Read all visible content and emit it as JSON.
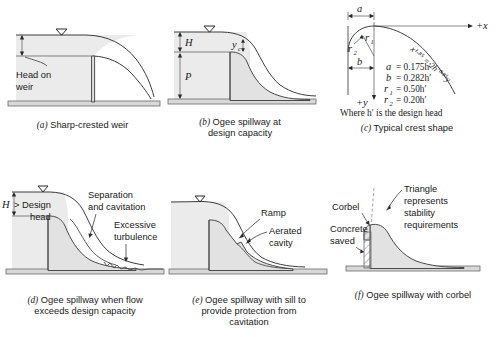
{
  "figure": {
    "panels": [
      {
        "id": "a",
        "caption_label": "(a)",
        "caption_text": "Sharp-crested weir",
        "annotations": [
          {
            "name": "head-on-weir-label",
            "text": "Head on\nweir"
          }
        ],
        "labels": {
          "head_line1": "Head on",
          "head_line2": "weir"
        }
      },
      {
        "id": "b",
        "caption_label": "(b)",
        "caption_text": "Ogee spillway at",
        "caption_text2": "design capacity",
        "labels": {
          "H": "H",
          "P": "P",
          "yc": "y",
          "yc_sub": "c"
        }
      },
      {
        "id": "c",
        "caption_label": "(c)",
        "caption_text": "Typical crest shape",
        "labels": {
          "a": "a",
          "b": "b",
          "r1": "r",
          "r1_sub": "1",
          "r2": "r",
          "r2_sub": "2",
          "axis_x": "+x",
          "axis_y": "+y"
        },
        "equations": [
          {
            "lhs": "a",
            "sub": "",
            "rhs": "= 0.175h′"
          },
          {
            "lhs": "b",
            "sub": "",
            "rhs": "= 0.282h′"
          },
          {
            "lhs": "r",
            "sub": "1",
            "rhs": "= 0.50h′"
          },
          {
            "lhs": "r",
            "sub": "2",
            "rhs": "= 0.20h′"
          }
        ],
        "note": "Where h′ is the design head",
        "curve_equation": "x¹·⁸⁵ = 2h′⁰·⁸⁵y"
      },
      {
        "id": "d",
        "caption_label": "(d)",
        "caption_text": "Ogee spillway when flow",
        "caption_text2": "exceeds design capacity",
        "labels": {
          "H": "H",
          "gt_design": "> Design",
          "head": "head",
          "separation1": "Separation",
          "separation2": "and cavitation",
          "turbulence1": "Excessive",
          "turbulence2": "turbulence"
        }
      },
      {
        "id": "e",
        "caption_label": "(e)",
        "caption_text": "Ogee spillway with sill to",
        "caption_text2": "provide protection from",
        "caption_text3": "cavitation",
        "labels": {
          "ramp": "Ramp",
          "aerated1": "Aerated",
          "aerated2": "cavity"
        }
      },
      {
        "id": "f",
        "caption_label": "(f)",
        "caption_text": "Ogee spillway with corbel",
        "labels": {
          "corbel": "Corbel",
          "concrete1": "Concrete",
          "concrete2": "saved",
          "triangle1": "Triangle",
          "triangle2": "represents",
          "triangle3": "stability",
          "triangle4": "requirements"
        }
      }
    ],
    "colors": {
      "water_fill": "#ebebeb",
      "body_fill": "#e2e2e2",
      "ground_fill": "#d8d8d8",
      "line": "#3c3c3c",
      "dashed": "#8a8a8a",
      "text": "#1a1a1a",
      "background": "#ffffff"
    }
  }
}
